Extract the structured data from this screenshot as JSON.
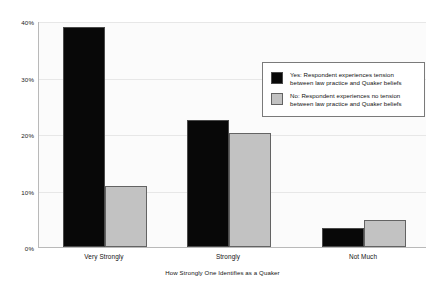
{
  "chart_data": {
    "type": "bar",
    "title": "",
    "subtitle": "",
    "xlabel": "How Strongly One Identifies as a Quaker",
    "ylabel": "",
    "categories": [
      "Very Strongly",
      "Strongly",
      "Not Much"
    ],
    "series": [
      {
        "name": "Yes: Respondent experiences tension between law practice and Quaker beliefs",
        "legend_line1": "Yes: Respondent experiences tension",
        "legend_line2": "between law practice and Quaker beliefs",
        "color": "#080808",
        "values": [
          38.9,
          22.5,
          3.4
        ]
      },
      {
        "name": "No: Respondent experiences no tension between law practice and Quaker beliefs",
        "legend_line1": "No: Respondent experiences no tension",
        "legend_line2": "between law practice and Quaker beliefs",
        "color": "#c2c2c2",
        "values": [
          10.8,
          20.2,
          4.8
        ]
      }
    ],
    "ylim": [
      0,
      40
    ],
    "yticks": [
      0,
      10,
      20,
      30,
      40
    ],
    "ytick_labels": [
      "0%",
      "10%",
      "20%",
      "30%",
      "40%"
    ],
    "grid": true,
    "legend_position": "upper right"
  },
  "axes": {
    "y_tick_0": "0%",
    "y_tick_1": "10%",
    "y_tick_2": "20%",
    "y_tick_3": "30%",
    "y_tick_4": "40%",
    "x_tick_0": "Very Strongly",
    "x_tick_1": "Strongly",
    "x_tick_2": "Not Much",
    "x_title": "How Strongly One Identifies as a Quaker"
  },
  "legend": {
    "yes_line1": "Yes: Respondent experiences tension",
    "yes_line2": "between law practice and Quaker beliefs",
    "no_line1": "No: Respondent experiences no tension",
    "no_line2": "between law practice and Quaker beliefs"
  }
}
